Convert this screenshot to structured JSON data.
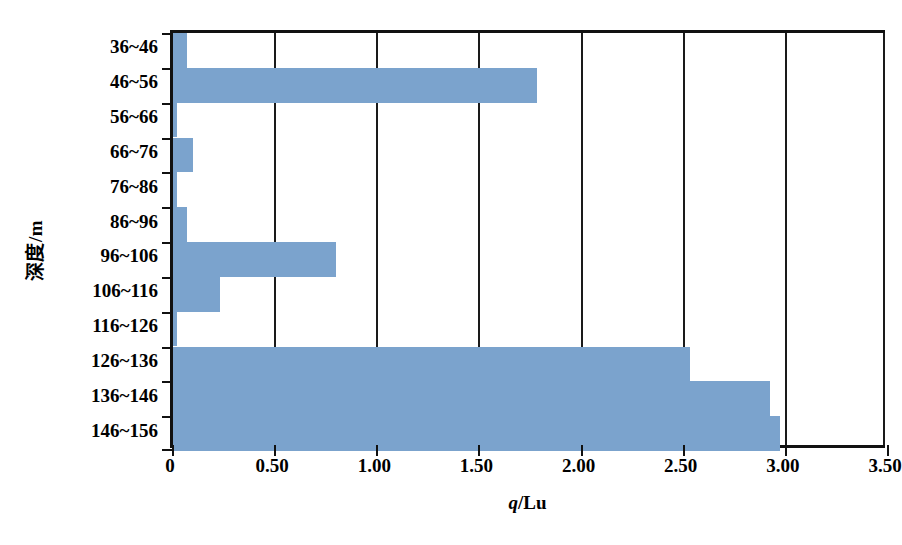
{
  "chart_data": {
    "type": "bar",
    "orientation": "horizontal",
    "title": "",
    "xlabel": "q/Lu",
    "ylabel": "深度/m",
    "categories": [
      "36~46",
      "46~56",
      "56~66",
      "66~76",
      "76~86",
      "86~96",
      "96~106",
      "106~116",
      "116~126",
      "126~136",
      "136~146",
      "146~156"
    ],
    "values": [
      0.07,
      1.78,
      0.02,
      0.1,
      0.02,
      0.07,
      0.8,
      0.23,
      0.02,
      2.53,
      2.92,
      2.97
    ],
    "xlim": [
      0,
      3.5
    ],
    "xticks": [
      0,
      0.5,
      1.0,
      1.5,
      2.0,
      2.5,
      3.0,
      3.5
    ],
    "xtick_labels": [
      "0",
      "0.50",
      "1.00",
      "1.50",
      "2.00",
      "2.50",
      "3.00",
      "3.50"
    ],
    "grid": "vertical",
    "legend": "none",
    "bar_color": "#7ba3cd",
    "axis_color": "#111111"
  },
  "axis": {
    "x_title_italic": "q",
    "x_title_rest": "/Lu",
    "y_title": "深度/m"
  }
}
